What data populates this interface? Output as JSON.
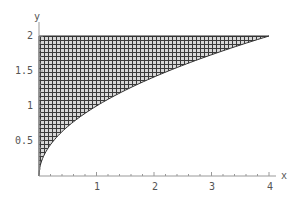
{
  "chart_data": {
    "type": "area",
    "title": "",
    "xlabel": "x",
    "ylabel": "y",
    "xlim": [
      0,
      4.2
    ],
    "ylim": [
      0,
      2.05
    ],
    "x_ticks": [
      "1",
      "2",
      "3",
      "4"
    ],
    "y_ticks": [
      "0.5",
      "1",
      "1.5",
      "2"
    ],
    "grid": false,
    "legend": null,
    "region": {
      "description": "Hatched region bounded by x = 0, y = 2, and the curve x = y^2",
      "boundary_curve": "x = y^2",
      "y_range": [
        0,
        2
      ],
      "fill": "crosshatch"
    },
    "series": [
      {
        "name": "x = y^2",
        "x": [
          0,
          0.0625,
          0.25,
          0.5625,
          1,
          1.5625,
          2.25,
          3.0625,
          4
        ],
        "y": [
          0,
          0.25,
          0.5,
          0.75,
          1,
          1.25,
          1.5,
          1.75,
          2
        ]
      }
    ]
  },
  "labels": {
    "x_axis": "x",
    "y_axis": "y",
    "x_ticks": [
      "1",
      "2",
      "3",
      "4"
    ],
    "y_ticks": [
      "0.5",
      "1",
      "1.5",
      "2"
    ]
  }
}
